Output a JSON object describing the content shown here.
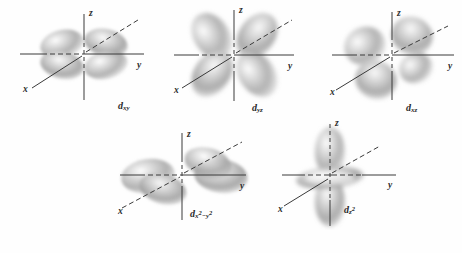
{
  "figure": {
    "background_color": "#fefefe",
    "lobe_color": "#9a9a9a",
    "axis_color": "#3a3a3a",
    "label_color": "#2b2b2b",
    "style": "grayscale shaded electron density lobes"
  },
  "axis_labels": {
    "x": "x",
    "y": "y",
    "z": "z"
  },
  "orbitals": [
    {
      "id": "dxy",
      "label_html": "d<sub>xy</sub>",
      "label_plain": "dxy",
      "row": 1,
      "col": 1,
      "lobes": 4,
      "orientation": "four lobes between the x and y axes (horizontal plane), viewed nearly edge-on",
      "axes": {
        "x": "diagonal lower-left to upper-right",
        "y": "horizontal right",
        "z": "vertical up"
      }
    },
    {
      "id": "dyz",
      "label_html": "d<sub>yz</sub>",
      "label_plain": "dyz",
      "row": 1,
      "col": 2,
      "lobes": 4,
      "orientation": "four lobes between the y and z axes (vertical yz plane), facing viewer",
      "axes": {
        "x": "diagonal lower-left to upper-right",
        "y": "horizontal right",
        "z": "vertical up"
      }
    },
    {
      "id": "dxz",
      "label_html": "d<sub>xz</sub>",
      "label_plain": "dxz",
      "row": 1,
      "col": 3,
      "lobes": 4,
      "orientation": "four lobes between the x and z axes, tilted toward the viewer",
      "axes": {
        "x": "diagonal lower-left to upper-right",
        "y": "horizontal right",
        "z": "vertical up"
      }
    },
    {
      "id": "dx2-y2",
      "label_html": "d<sub>x<sup>2</sup>&minus;y<sup>2</sup></sub>",
      "label_plain": "dx2-y2",
      "row": 2,
      "col": 1,
      "lobes": 4,
      "orientation": "four lobes along the x and y axes (horizontal plane), viewed edge-on",
      "axes": {
        "x": "diagonal lower-left to upper-right",
        "y": "horizontal right",
        "z": "vertical up"
      }
    },
    {
      "id": "dz2",
      "label_html": "d<sub>z<sup>2</sup></sub>",
      "label_plain": "dz2",
      "row": 2,
      "col": 2,
      "lobes": 2,
      "extra_feature": "toroidal ring (donut) in the xy plane around the origin",
      "orientation": "two large lobes along the z axis plus an equatorial torus",
      "axes": {
        "x": "diagonal lower-left to upper-right",
        "y": "horizontal right",
        "z": "vertical up"
      }
    }
  ]
}
